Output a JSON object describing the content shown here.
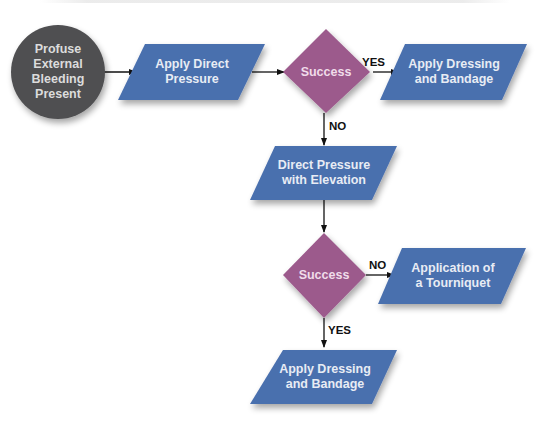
{
  "diagram": {
    "type": "flowchart",
    "colors": {
      "start_circle": "#4f4f51",
      "process": "#4a6fae",
      "decision": "#9c5a8c",
      "arrow": "#111111"
    },
    "nodes": [
      {
        "id": "start",
        "shape": "circle",
        "label": "Profuse\nExternal\nBleeding\nPresent"
      },
      {
        "id": "direct_pressure",
        "shape": "parallelogram",
        "label": "Apply Direct\nPressure"
      },
      {
        "id": "decision1",
        "shape": "diamond",
        "label": "Success"
      },
      {
        "id": "dressing1",
        "shape": "parallelogram",
        "label": "Apply Dressing\nand Bandage"
      },
      {
        "id": "elevation",
        "shape": "parallelogram",
        "label": "Direct Pressure\nwith Elevation"
      },
      {
        "id": "decision2",
        "shape": "diamond",
        "label": "Success"
      },
      {
        "id": "tourniquet",
        "shape": "parallelogram",
        "label": "Application of\na Tourniquet"
      },
      {
        "id": "dressing2",
        "shape": "parallelogram",
        "label": "Apply Dressing\nand Bandage"
      }
    ],
    "edges": [
      {
        "from": "start",
        "to": "direct_pressure",
        "label": ""
      },
      {
        "from": "direct_pressure",
        "to": "decision1",
        "label": ""
      },
      {
        "from": "decision1",
        "to": "dressing1",
        "label": "YES"
      },
      {
        "from": "decision1",
        "to": "elevation",
        "label": "NO"
      },
      {
        "from": "elevation",
        "to": "decision2",
        "label": ""
      },
      {
        "from": "decision2",
        "to": "tourniquet",
        "label": "NO"
      },
      {
        "from": "decision2",
        "to": "dressing2",
        "label": "YES"
      }
    ]
  }
}
